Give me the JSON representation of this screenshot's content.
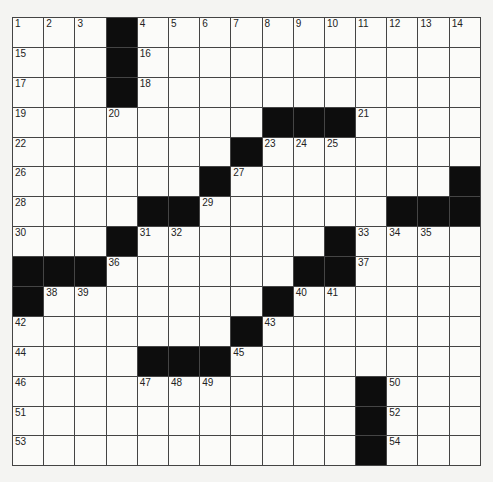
{
  "puzzle": {
    "rows": 15,
    "cols": 14,
    "grid": [
      "...#..........",
      "...#..........",
      "...#..........",
      ".......###....",
      ".......#......",
      "......#......#",
      "....##.....###",
      "...#......#...",
      "###.......#...",
      "#.......#.....",
      ".......#......",
      "....###.......",
      "...........#..",
      "...........#..",
      "...........#.."
    ],
    "numbers": [
      {
        "r": 0,
        "c": 0,
        "n": "1"
      },
      {
        "r": 0,
        "c": 1,
        "n": "2"
      },
      {
        "r": 0,
        "c": 2,
        "n": "3"
      },
      {
        "r": 0,
        "c": 4,
        "n": "4"
      },
      {
        "r": 0,
        "c": 5,
        "n": "5"
      },
      {
        "r": 0,
        "c": 6,
        "n": "6"
      },
      {
        "r": 0,
        "c": 7,
        "n": "7"
      },
      {
        "r": 0,
        "c": 8,
        "n": "8"
      },
      {
        "r": 0,
        "c": 9,
        "n": "9"
      },
      {
        "r": 0,
        "c": 10,
        "n": "10"
      },
      {
        "r": 0,
        "c": 11,
        "n": "11"
      },
      {
        "r": 0,
        "c": 12,
        "n": "12"
      },
      {
        "r": 0,
        "c": 13,
        "n": "13"
      },
      {
        "r": 0,
        "c": 14,
        "n": "14"
      },
      {
        "r": 1,
        "c": 0,
        "n": "15"
      },
      {
        "r": 1,
        "c": 4,
        "n": "16"
      },
      {
        "r": 2,
        "c": 0,
        "n": "17"
      },
      {
        "r": 2,
        "c": 4,
        "n": "18"
      },
      {
        "r": 3,
        "c": 0,
        "n": "19"
      },
      {
        "r": 3,
        "c": 3,
        "n": "20"
      },
      {
        "r": 3,
        "c": 11,
        "n": "21"
      },
      {
        "r": 4,
        "c": 0,
        "n": "22"
      },
      {
        "r": 4,
        "c": 8,
        "n": "23"
      },
      {
        "r": 4,
        "c": 9,
        "n": "24"
      },
      {
        "r": 4,
        "c": 10,
        "n": "25"
      },
      {
        "r": 5,
        "c": 0,
        "n": "26"
      },
      {
        "r": 5,
        "c": 7,
        "n": "27"
      },
      {
        "r": 6,
        "c": 0,
        "n": "28"
      },
      {
        "r": 6,
        "c": 6,
        "n": "29"
      },
      {
        "r": 7,
        "c": 0,
        "n": "30"
      },
      {
        "r": 7,
        "c": 4,
        "n": "31"
      },
      {
        "r": 7,
        "c": 5,
        "n": "32"
      },
      {
        "r": 7,
        "c": 11,
        "n": "33"
      },
      {
        "r": 7,
        "c": 12,
        "n": "34"
      },
      {
        "r": 7,
        "c": 13,
        "n": "35"
      },
      {
        "r": 8,
        "c": 3,
        "n": "36"
      },
      {
        "r": 8,
        "c": 11,
        "n": "37"
      },
      {
        "r": 9,
        "c": 1,
        "n": "38"
      },
      {
        "r": 9,
        "c": 2,
        "n": "39"
      },
      {
        "r": 9,
        "c": 9,
        "n": "40"
      },
      {
        "r": 9,
        "c": 10,
        "n": "41"
      },
      {
        "r": 10,
        "c": 0,
        "n": "42"
      },
      {
        "r": 10,
        "c": 8,
        "n": "43"
      },
      {
        "r": 11,
        "c": 0,
        "n": "44"
      },
      {
        "r": 11,
        "c": 7,
        "n": "45"
      },
      {
        "r": 12,
        "c": 0,
        "n": "46"
      },
      {
        "r": 12,
        "c": 4,
        "n": "47"
      },
      {
        "r": 12,
        "c": 5,
        "n": "48"
      },
      {
        "r": 12,
        "c": 6,
        "n": "49"
      },
      {
        "r": 12,
        "c": 12,
        "n": "50"
      },
      {
        "r": 13,
        "c": 0,
        "n": "51"
      },
      {
        "r": 13,
        "c": 12,
        "n": "52"
      },
      {
        "r": 14,
        "c": 0,
        "n": "53"
      },
      {
        "r": 14,
        "c": 12,
        "n": "54"
      }
    ]
  }
}
